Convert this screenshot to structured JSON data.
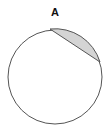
{
  "diagram": {
    "label": "A",
    "circle": {
      "cx": 55,
      "cy": 77,
      "r": 47,
      "stroke": "#555555",
      "fill": "#ffffff"
    },
    "segment": {
      "start": [
        50,
        29
      ],
      "end": [
        100,
        62
      ],
      "fill": "#d4d4d4",
      "stroke": "#555555"
    },
    "label_position": [
      55,
      16
    ]
  }
}
